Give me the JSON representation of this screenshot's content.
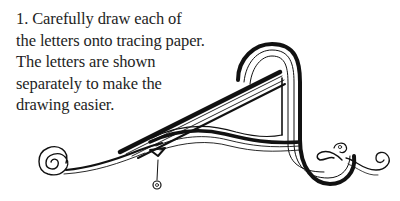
{
  "instruction": {
    "step_number": "1.",
    "lines": [
      "1.  Carefully draw each of",
      "the letters onto tracing paper.",
      "The letters are shown",
      "separately to make the",
      "drawing easier."
    ]
  },
  "illustration": {
    "subject": "decorative-letter-A",
    "stroke_color": "#111111",
    "background_color": "#ffffff"
  }
}
